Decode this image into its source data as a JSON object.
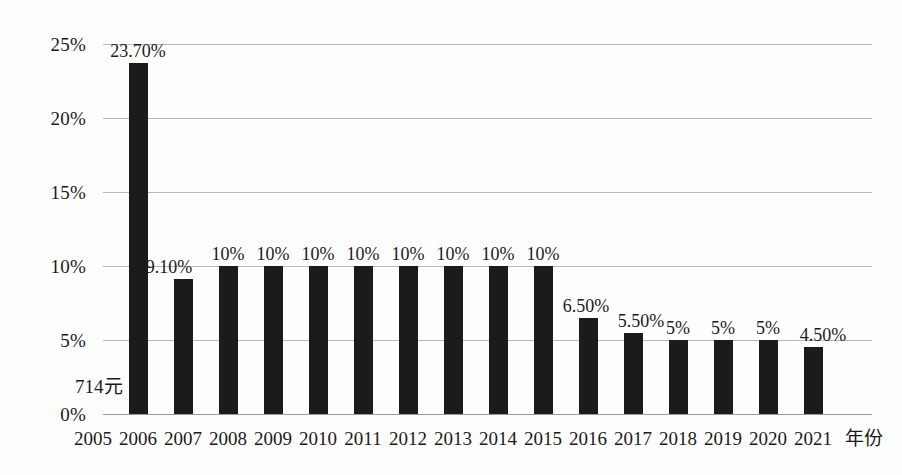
{
  "chart_data": {
    "type": "bar",
    "title": "",
    "subtitle": "",
    "xlabel": "年份",
    "ylabel": "",
    "categories": [
      "2005",
      "2006",
      "2007",
      "2008",
      "2009",
      "2010",
      "2011",
      "2012",
      "2013",
      "2014",
      "2015",
      "2016",
      "2017",
      "2018",
      "2019",
      "2020",
      "2021"
    ],
    "values": [
      null,
      23.7,
      9.1,
      10,
      10,
      10,
      10,
      10,
      10,
      10,
      10,
      6.5,
      5.5,
      5,
      5,
      5,
      4.5
    ],
    "data_labels": [
      "",
      "23.70%",
      "9.10%",
      "10%",
      "10%",
      "10%",
      "10%",
      "10%",
      "10%",
      "10%",
      "10%",
      "6.50%",
      "5.50%",
      "5%",
      "5%",
      "5%",
      "4.50%"
    ],
    "ylim": [
      0,
      25
    ],
    "ytick_values": [
      0,
      5,
      10,
      15,
      20,
      25
    ],
    "ytick_labels": [
      "0%",
      "5%",
      "10%",
      "15%",
      "20%",
      "25%"
    ],
    "grid": true,
    "legend": false,
    "legend_position": "none",
    "bar_color": "#1b1b1b",
    "grid_color": "#b9b9b9",
    "background_color": "#ffffff",
    "annotations": [
      {
        "text": "714元",
        "category": "2005",
        "value": 1.2
      }
    ]
  },
  "axis": {
    "x_title": "年份"
  }
}
